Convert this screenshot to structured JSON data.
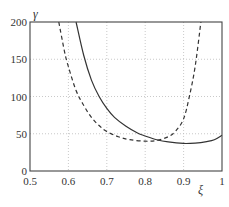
{
  "chart_data": {
    "type": "line",
    "title": "",
    "xlabel": "ξ",
    "ylabel": "γ",
    "xlim": [
      0.5,
      1.0
    ],
    "ylim": [
      0,
      200
    ],
    "grid": true,
    "legend": null,
    "x_ticks": [
      "0.5",
      "0.6",
      "0.7",
      "0.8",
      "0.9",
      "1"
    ],
    "y_ticks": [
      "0",
      "50",
      "100",
      "150",
      "200"
    ],
    "series": [
      {
        "name": "solid",
        "style": "solid",
        "color": "#333333",
        "x": [
          0.62,
          0.64,
          0.66,
          0.68,
          0.7,
          0.72,
          0.75,
          0.78,
          0.8,
          0.83,
          0.86,
          0.9,
          0.93,
          0.96,
          0.98,
          1.0
        ],
        "y": [
          200,
          155,
          122,
          100,
          84,
          72,
          60,
          51,
          47,
          42,
          39,
          37,
          37.5,
          39.5,
          42,
          48
        ]
      },
      {
        "name": "dashed",
        "style": "dashed",
        "color": "#333333",
        "x": [
          0.575,
          0.59,
          0.6,
          0.62,
          0.64,
          0.66,
          0.68,
          0.7,
          0.73,
          0.76,
          0.8,
          0.83,
          0.86,
          0.88,
          0.9,
          0.915,
          0.93,
          0.945
        ],
        "y": [
          200,
          160,
          140,
          108,
          88,
          72,
          61,
          53,
          46,
          42,
          40,
          41,
          46,
          54,
          70,
          100,
          140,
          200
        ]
      }
    ]
  },
  "axes": {
    "xlabel": "ξ",
    "ylabel": "γ"
  }
}
